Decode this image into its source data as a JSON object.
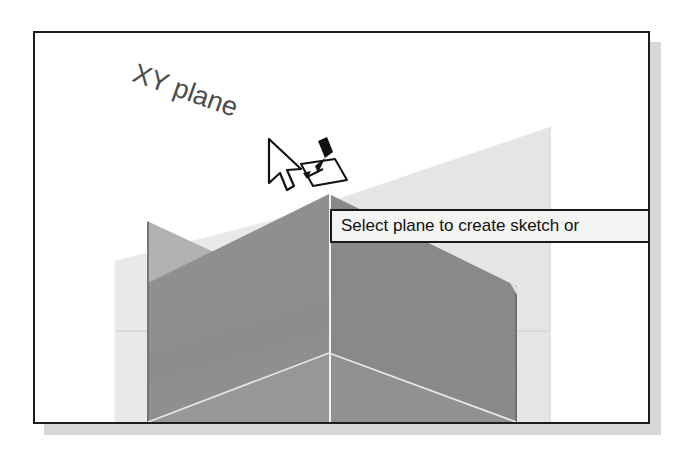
{
  "app": {
    "kind": "cad-3d-viewport",
    "frame_border_color": "#1d1d1d",
    "frame_shadow_color": "#d8d8d8",
    "background_color": "#ffffff"
  },
  "viewport": {
    "plane_label": "XY plane",
    "plane_label_color": "#4c4c4c",
    "highlight_plane_color": "#a9a9a9",
    "solid_front_color": "#8c8c8c",
    "solid_side_color": "#7e7e7e",
    "solid_floor_color": "#9a9a9a",
    "ghost_plane_color": "#dcdcdc",
    "ghost_plane_light_color": "#e8e8e8",
    "edge_highlight_color": "#f2f2f2"
  },
  "tooltip": {
    "text": "Select plane to create sketch or",
    "background_color": "#f4f4f2",
    "border_color": "#191919",
    "text_color": "#111111"
  },
  "cursor": {
    "pointer_icon": "arrow-pointer-icon",
    "badge_icon": "create-sketch-on-plane-icon",
    "x": 272,
    "y": 140
  }
}
